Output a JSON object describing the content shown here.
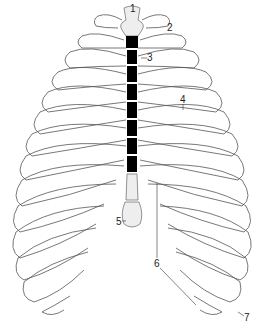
{
  "figure": {
    "labels": [
      {
        "id": "1",
        "text": "1",
        "x": 131,
        "y": 4
      },
      {
        "id": "2",
        "text": "2",
        "x": 170,
        "y": 24
      },
      {
        "id": "3",
        "text": "3",
        "x": 147,
        "y": 56
      },
      {
        "id": "4",
        "text": "4",
        "x": 181,
        "y": 96
      },
      {
        "id": "5",
        "text": "5",
        "x": 117,
        "y": 217
      },
      {
        "id": "6",
        "text": "6",
        "x": 155,
        "y": 261
      },
      {
        "id": "7",
        "text": "7",
        "x": 245,
        "y": 314
      }
    ]
  },
  "colors": {
    "line": "#555555",
    "cartilage_fill": "#eeeeee",
    "background": "#ffffff"
  }
}
